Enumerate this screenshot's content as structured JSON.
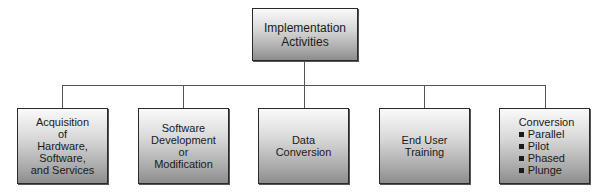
{
  "diagram": {
    "root": {
      "label_lines": [
        "Implementation",
        "Activities"
      ]
    },
    "children": [
      {
        "label_lines": [
          "Acquisition",
          "of",
          "Hardware,",
          "Software,",
          "and Services"
        ]
      },
      {
        "label_lines": [
          "Software",
          "Development",
          "or",
          "Modification"
        ]
      },
      {
        "label_lines": [
          "Data",
          "Conversion"
        ]
      },
      {
        "label_lines": [
          "End User",
          "Training"
        ]
      },
      {
        "title": "Conversion",
        "bullets": [
          "Parallel",
          "Pilot",
          "Phased",
          "Plunge"
        ]
      }
    ]
  }
}
